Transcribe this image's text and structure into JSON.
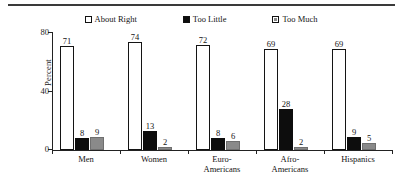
{
  "figure": {
    "rule_present": true
  },
  "legend": {
    "position": "top-center",
    "entries": [
      {
        "label": "About Right",
        "marker": "hollow-square",
        "color": "#ffffff"
      },
      {
        "label": "Too Little",
        "marker": "filled-square",
        "color": "#0d0d0d"
      },
      {
        "label": "Too Much",
        "marker": "hatched-square",
        "color": "#8a8a8a"
      }
    ]
  },
  "axes": {
    "ylabel": "Percent",
    "yticks": [
      "0",
      "40",
      "80"
    ],
    "ytick_values": [
      0,
      40,
      80
    ]
  },
  "chart_data": {
    "type": "bar",
    "title": "",
    "xlabel": "",
    "ylabel": "Percent",
    "ylim": [
      0,
      80
    ],
    "yticks": [
      0,
      40,
      80
    ],
    "grid": false,
    "legend_position": "top-center",
    "categories": [
      "Men",
      "Women",
      "Euro-\nAmericans",
      "Afro-\nAmericans",
      "Hispanics"
    ],
    "series": [
      {
        "name": "About Right",
        "color": "#ffffff",
        "values": [
          71,
          74,
          72,
          69,
          69
        ]
      },
      {
        "name": "Too Little",
        "color": "#0d0d0d",
        "values": [
          8,
          13,
          8,
          28,
          9
        ]
      },
      {
        "name": "Too Much",
        "color": "#8a8a8a",
        "values": [
          9,
          2,
          6,
          2,
          5
        ]
      }
    ]
  }
}
